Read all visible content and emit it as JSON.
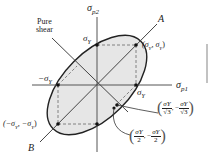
{
  "diagram": {
    "axes": {
      "horizontal_label": "σ",
      "horizontal_sub": "p1",
      "vertical_label": "σ",
      "vertical_sub": "p2"
    },
    "lines": {
      "A": "A",
      "B": "B",
      "pure_shear_line1": "Pure",
      "pure_shear_line2": "shear"
    },
    "points": {
      "sigma_y_top": "σ",
      "sigma_y_top_sub": "Y",
      "sigma_y_right": "σ",
      "sigma_y_right_sub": "Y",
      "neg_sigma_y_left": "−σ",
      "neg_sigma_y_left_sub": "Y",
      "corner_pos": "(σ",
      "corner_pos_mid": ", σ",
      "corner_pos_end": ")",
      "corner_sub": "Y",
      "corner_neg": "(−σ",
      "corner_neg_mid": ", −σ",
      "corner_neg_end": ")",
      "corner_neg_sub": "Y"
    },
    "annotations": {
      "sqrt3_num": "σY",
      "sqrt3_den": "√3",
      "sqrt3_num2": "σY",
      "sqrt3_den2": "√3",
      "sqrt3_sep": ", −",
      "half_num": "σY",
      "half_den": "2",
      "half_num2": "σY",
      "half_den2": "2",
      "half_sep": ", −"
    },
    "colors": {
      "fill": "#e6e6e6",
      "line": "#222222",
      "axis": "#555555",
      "dash": "#777777"
    }
  }
}
